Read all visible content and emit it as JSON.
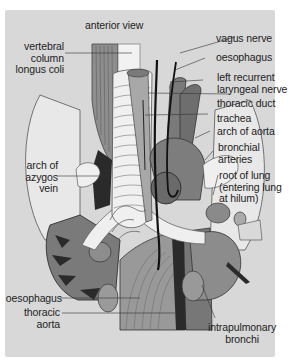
{
  "figure": {
    "title": "anterior view",
    "panel_background": "#d8d8d8",
    "labels_left": [
      {
        "id": "vertebral-column-longus-coli",
        "lines": [
          "vertebral",
          "column",
          "longus coli"
        ]
      },
      {
        "id": "arch-of-azygos-vein",
        "lines": [
          "arch of",
          "azygos",
          "vein"
        ]
      },
      {
        "id": "oesophagus-left",
        "lines": [
          "oesophagus"
        ]
      },
      {
        "id": "thoracic-aorta",
        "lines": [
          "thoracic",
          "aorta"
        ]
      }
    ],
    "labels_right": [
      {
        "id": "vagus-nerve",
        "lines": [
          "vagus nerve"
        ]
      },
      {
        "id": "oesophagus-right",
        "lines": [
          "oesophagus"
        ]
      },
      {
        "id": "left-recurrent-laryngeal-nerve",
        "lines": [
          "left recurrent",
          "laryngeal nerve"
        ]
      },
      {
        "id": "thoracic-duct",
        "lines": [
          "thoracic duct"
        ]
      },
      {
        "id": "trachea",
        "lines": [
          "trachea"
        ]
      },
      {
        "id": "arch-of-aorta",
        "lines": [
          "arch of aorta"
        ]
      },
      {
        "id": "bronchial-arteries",
        "lines": [
          "bronchial",
          "arteries"
        ]
      },
      {
        "id": "root-of-lung",
        "lines": [
          "root of lung",
          "(entering lung",
          "at hilum)"
        ]
      }
    ],
    "labels_bottom": [
      {
        "id": "intrapulmonary-bronchi",
        "lines": [
          "intrapulmonary",
          "bronchi"
        ]
      }
    ],
    "colors": {
      "trachea": "#efefef",
      "muscle": "#8a8a8a",
      "aorta": "#6f6f6f",
      "oesophagus": "#9c9c9c",
      "dark": "#2a2a2a",
      "lung_root": "#7d7d7d",
      "vertebra": "#b5b5b5"
    }
  }
}
